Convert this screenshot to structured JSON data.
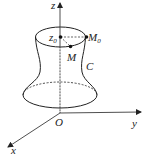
{
  "diagram": {
    "type": "surface-of-revolution",
    "axes": {
      "x_label": "x",
      "y_label": "y",
      "z_label": "z",
      "origin_label": "O"
    },
    "points": {
      "z0": {
        "label": "z",
        "subscript": "0"
      },
      "M0": {
        "label": "M",
        "subscript": "0"
      },
      "M": {
        "label": "M"
      }
    },
    "curve_label": "C",
    "colors": {
      "stroke": "#222222",
      "background": "#ffffff"
    }
  }
}
